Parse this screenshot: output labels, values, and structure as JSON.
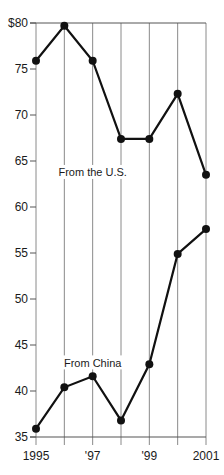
{
  "chart_data": {
    "type": "line",
    "title": "",
    "xlabel": "",
    "ylabel": "",
    "ylim": [
      35,
      80
    ],
    "y_ticks": [
      35,
      40,
      45,
      50,
      55,
      60,
      65,
      70,
      75,
      80
    ],
    "y_tick_labels": [
      "35",
      "40",
      "45",
      "50",
      "55",
      "60",
      "65",
      "70",
      "75",
      "$80"
    ],
    "x": [
      1995,
      1996,
      1997,
      1998,
      1999,
      2000,
      2001
    ],
    "x_tick_labels": [
      "1995",
      "",
      "'97",
      "",
      "'99",
      "",
      "2001"
    ],
    "grid": {
      "vertical": true,
      "horizontal": false
    },
    "legend": "inline labels",
    "series": [
      {
        "name": "From the U.S.",
        "values": [
          75.9,
          79.7,
          75.9,
          67.4,
          67.4,
          72.3,
          63.5
        ],
        "label_pos": [
          1997.0,
          63.7
        ]
      },
      {
        "name": "From China",
        "values": [
          35.9,
          40.4,
          41.6,
          36.8,
          42.9,
          54.9,
          57.6
        ],
        "label_pos": [
          1997.0,
          43.0
        ]
      }
    ]
  },
  "colors": {
    "line": "#111111",
    "grid": "#8a8a8a",
    "axis": "#555555",
    "background": "#ffffff"
  }
}
